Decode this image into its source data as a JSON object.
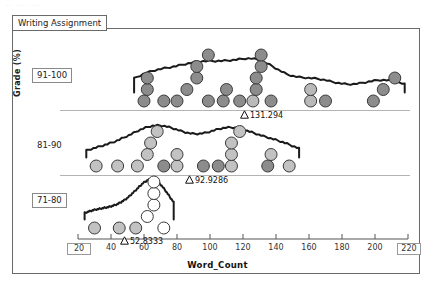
{
  "window": {
    "faint_header_text": "..  ...    ....",
    "tab_label": "Writing Assignment"
  },
  "chart_data": {
    "type": "scatter",
    "title": "Writing Assignment",
    "xlabel": "Word_Count",
    "ylabel": "Grade (%)",
    "xlim": [
      20,
      220
    ],
    "xticks": [
      20,
      40,
      60,
      80,
      100,
      120,
      140,
      160,
      180,
      200,
      220
    ],
    "xtick_boxed": [
      20,
      220
    ],
    "grid": false,
    "legend": "none",
    "groups": [
      {
        "label": "91-100",
        "label_boxed": true,
        "mean": 131.294,
        "mean_label": "131.294",
        "values": [
          60,
          62,
          62,
          72,
          80,
          86,
          92,
          92,
          99,
          99,
          108,
          110,
          118,
          126,
          128,
          128,
          131,
          131,
          137,
          161,
          161,
          170,
          199,
          205,
          212
        ]
      },
      {
        "label": "81-90",
        "label_boxed": false,
        "mean": 92.9286,
        "mean_label": "92.9286",
        "values": [
          31,
          44,
          56,
          62,
          64,
          68,
          72,
          80,
          80,
          96,
          105,
          113,
          113,
          113,
          118,
          135,
          137,
          148
        ]
      },
      {
        "label": "71-80",
        "label_boxed": true,
        "mean": 52.8333,
        "mean_label": "52.8333",
        "values": [
          30,
          45,
          55,
          62,
          66,
          66,
          66,
          72
        ]
      }
    ]
  },
  "axis": {
    "xlabels": [
      "20",
      "40",
      "60",
      "80",
      "100",
      "120",
      "140",
      "160",
      "180",
      "200",
      "220"
    ]
  }
}
